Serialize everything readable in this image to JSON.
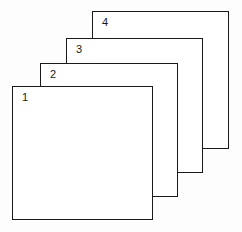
{
  "diagram": {
    "type": "stacked-layers",
    "canvas": {
      "width": 242,
      "height": 232,
      "background": "#fdfdfd"
    },
    "style": {
      "panel_fill": "#ffffff",
      "panel_stroke": "#1a1a1a",
      "panel_stroke_width": 1.6,
      "label_color": "#1a1a1a"
    },
    "panels": [
      {
        "label": "4",
        "z": 1,
        "left": 92,
        "top": 11,
        "width": 137,
        "height": 138
      },
      {
        "label": "3",
        "z": 2,
        "left": 66,
        "top": 38,
        "width": 137,
        "height": 135
      },
      {
        "label": "2",
        "z": 3,
        "left": 40,
        "top": 63,
        "width": 138,
        "height": 134
      },
      {
        "label": "1",
        "z": 4,
        "left": 12,
        "top": 86,
        "width": 141,
        "height": 134
      }
    ]
  }
}
